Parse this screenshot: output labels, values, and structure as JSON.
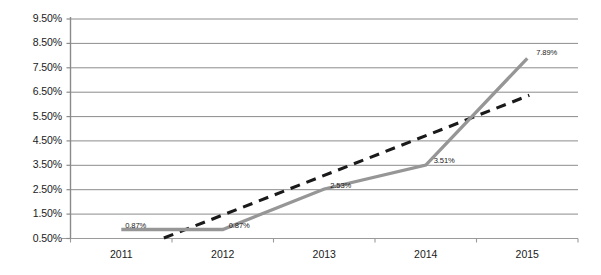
{
  "chart_data": {
    "type": "line",
    "title": "",
    "subtitle": "",
    "xlabel": "",
    "ylabel": "",
    "categories": [
      "2011",
      "2012",
      "2013",
      "2014",
      "2015"
    ],
    "ylim": [
      0.5,
      9.5
    ],
    "ytick_values": [
      0.5,
      1.5,
      2.5,
      3.5,
      4.5,
      5.5,
      6.5,
      7.5,
      8.5,
      9.5
    ],
    "ytick_labels": [
      "0.50%",
      "1.50%",
      "2.50%",
      "3.50%",
      "4.50%",
      "5.50%",
      "6.50%",
      "7.50%",
      "8.50%",
      "9.50%"
    ],
    "grid": true,
    "grid_axis": "y",
    "legend": "none",
    "series": [
      {
        "name": "series-main",
        "style": "solid",
        "color": "#969696",
        "values": [
          0.87,
          0.87,
          2.53,
          3.51,
          7.89
        ],
        "data_labels": [
          "0.87%",
          "0.87%",
          "2.53%",
          "3.51%",
          "7.89%"
        ]
      },
      {
        "name": "linear-trendline",
        "style": "dashed",
        "color": "#1a1a1a",
        "x_start_category_fraction": 0.42,
        "x_end_category_fraction": 4.02,
        "y_start": 0.52,
        "y_end": 6.37
      }
    ]
  },
  "axes": {
    "y_axis_line_color": "#808080",
    "x_axis_line_color": "#808080",
    "gridline_color": "#8c8c8c"
  }
}
